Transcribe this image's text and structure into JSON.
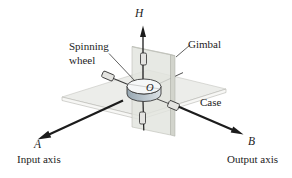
{
  "figure": {
    "type": "gyroscope-gimbal-diagram"
  },
  "labels": {
    "h_axis": "H",
    "spinning_wheel_line1": "Spinning",
    "spinning_wheel_line2": "wheel",
    "gimbal": "Gimbal",
    "case": "Case",
    "origin": "O",
    "a_point": "A",
    "input_axis": "Input axis",
    "b_point": "B",
    "output_axis": "Output axis"
  },
  "colors": {
    "background": "#ffffff",
    "line": "#1c1c1c",
    "thin_line": "#3a3a3a",
    "text": "#1c1c1c",
    "horizontal_plane_fill": "#ecedea",
    "horizontal_plane_edge": "#b9bab4",
    "horizontal_plane_side": "#f7f7f5",
    "vertical_plane_fill": "#e2e4de",
    "vertical_plane_edge": "#b6b8b0",
    "vertical_plane_side": "#d2d4cc",
    "vertical_plane_top": "#eff0ec",
    "disk_top_fill": "#f5f7f8",
    "disk_side_dark": "#97a7b2",
    "disk_side_light": "#dce2e6",
    "disk_outline": "#3a3a3a",
    "bearing_fill": "#e4e4e1",
    "bearing_outline": "#2c2c2c"
  }
}
